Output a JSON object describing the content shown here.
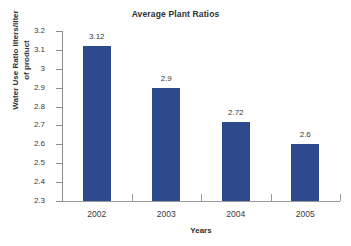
{
  "chart_data": {
    "type": "bar",
    "title": "Average Plant Ratios",
    "xlabel": "Years",
    "ylabel": "Water Use Ratio liters/liter of product",
    "ylabel_lines": [
      "Water Use Ratio liters/liter",
      "of product"
    ],
    "categories": [
      "2002",
      "2003",
      "2004",
      "2005"
    ],
    "values": [
      3.12,
      2.9,
      2.72,
      2.6
    ],
    "value_labels": [
      "3.12",
      "2.9",
      "2.72",
      "2.6"
    ],
    "ylim": [
      2.3,
      3.2
    ],
    "ytick_values": [
      3.2,
      3.1,
      3.0,
      2.9,
      2.8,
      2.7,
      2.6,
      2.5,
      2.4,
      2.3
    ],
    "ytick_labels": [
      "3.2",
      "3.1",
      "3",
      "2.9",
      "2.8",
      "2.7",
      "2.6",
      "2.5",
      "2.4",
      "2.3"
    ],
    "grid": false,
    "legend": false,
    "bar_color": "#2c4a8c",
    "axis_color": "#8d8d8d",
    "text_color": "#3a3a3a",
    "background": "#ffffff"
  }
}
